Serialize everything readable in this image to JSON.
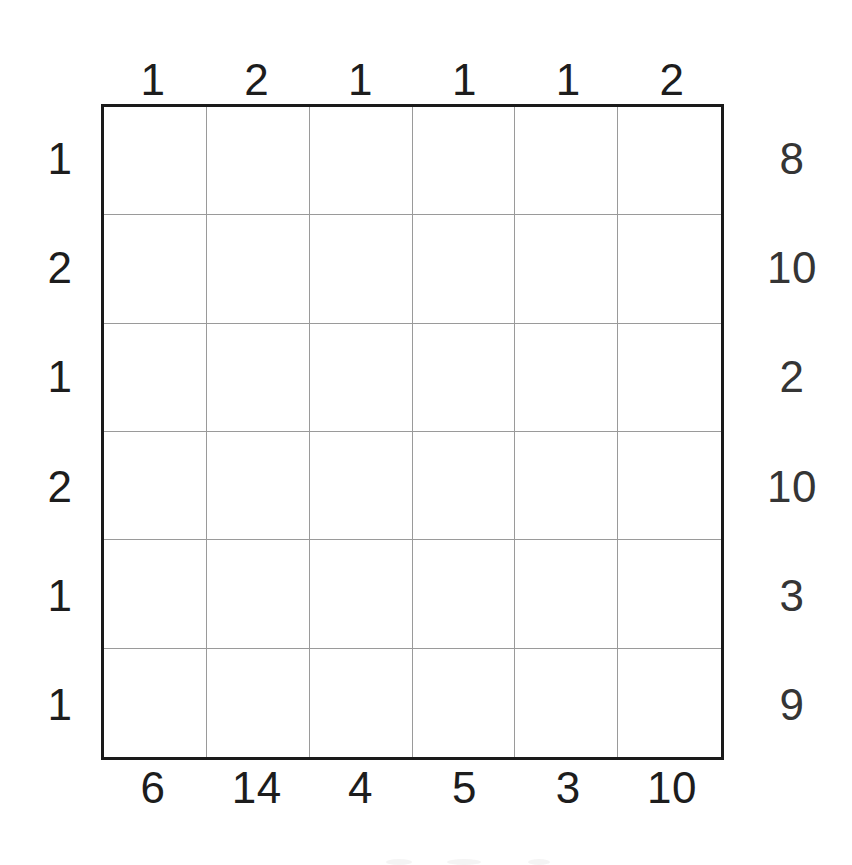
{
  "puzzle": {
    "type": "number-grid-puzzle",
    "rows": 6,
    "columns": 6,
    "cells_empty": true,
    "ink_color": "#1d1d1d",
    "border_color": "#1a1a1a",
    "gridline_color": "#9a9a9a",
    "background_color": "#ffffff",
    "clues": {
      "top": [
        "1",
        "2",
        "1",
        "1",
        "1",
        "2"
      ],
      "bottom": [
        "6",
        "14",
        "4",
        "5",
        "3",
        "10"
      ],
      "left": [
        "1",
        "2",
        "1",
        "2",
        "1",
        "1"
      ],
      "right": [
        "8",
        "10",
        "2",
        "10",
        "3",
        "9"
      ]
    }
  }
}
